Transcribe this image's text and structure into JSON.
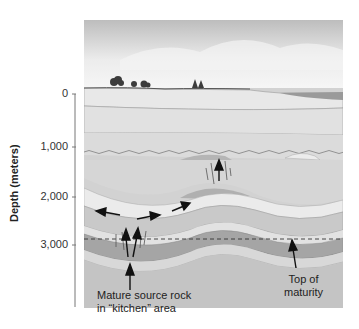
{
  "figure": {
    "axis": {
      "title": "Depth (meters)",
      "ticks": [
        {
          "label": "0",
          "y": 94
        },
        {
          "label": "1,000",
          "y": 147
        },
        {
          "label": "2,000",
          "y": 197
        },
        {
          "label": "3,000",
          "y": 245
        }
      ]
    },
    "annotations": {
      "source_rock_line1": "Mature source rock",
      "source_rock_line2": "in “kitchen” area",
      "maturity_line1": "Top of",
      "maturity_line2": "maturity"
    },
    "colors": {
      "sky_top": "#b9b9b9",
      "sky_bottom": "#f2f2f2",
      "surface_layer": "#e6e6e6",
      "upper_layer": "#dcdcdc",
      "mid_layer": "#cfcfcf",
      "deep_layer": "#c2c2c2",
      "source_rock": "#a3a3a3",
      "reservoir": "#e9e9e9",
      "arrow": "#111111"
    }
  }
}
